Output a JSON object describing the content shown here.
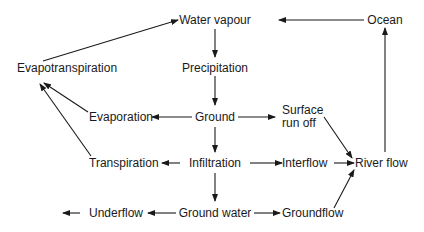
{
  "diagram": {
    "type": "flowchart",
    "title": "",
    "nodes": [
      {
        "id": "water_vapour",
        "label": "Water vapour"
      },
      {
        "id": "ocean",
        "label": "Ocean"
      },
      {
        "id": "evapotranspiration",
        "label": "Evapotranspiration"
      },
      {
        "id": "precipitation",
        "label": "Precipitation"
      },
      {
        "id": "evaporation",
        "label": "Evaporation"
      },
      {
        "id": "ground",
        "label": "Ground"
      },
      {
        "id": "surface_run_off",
        "label": "Surface run off",
        "lines": [
          "Surface",
          "run off"
        ]
      },
      {
        "id": "transpiration",
        "label": "Transpiration"
      },
      {
        "id": "infiltration",
        "label": "Infiltration"
      },
      {
        "id": "interflow",
        "label": "Interflow"
      },
      {
        "id": "river_flow",
        "label": "River flow"
      },
      {
        "id": "underflow",
        "label": "Underflow"
      },
      {
        "id": "ground_water",
        "label": "Ground water"
      },
      {
        "id": "groundflow",
        "label": "Groundflow"
      }
    ],
    "edges": [
      {
        "from": "ocean",
        "to": "water_vapour"
      },
      {
        "from": "evapotranspiration",
        "to": "water_vapour"
      },
      {
        "from": "water_vapour",
        "to": "precipitation"
      },
      {
        "from": "precipitation",
        "to": "ground"
      },
      {
        "from": "ground",
        "to": "evaporation"
      },
      {
        "from": "ground",
        "to": "surface_run_off"
      },
      {
        "from": "ground",
        "to": "infiltration"
      },
      {
        "from": "evaporation",
        "to": "evapotranspiration"
      },
      {
        "from": "transpiration",
        "to": "evapotranspiration"
      },
      {
        "from": "infiltration",
        "to": "transpiration"
      },
      {
        "from": "infiltration",
        "to": "interflow"
      },
      {
        "from": "infiltration",
        "to": "ground_water"
      },
      {
        "from": "surface_run_off",
        "to": "river_flow"
      },
      {
        "from": "interflow",
        "to": "river_flow"
      },
      {
        "from": "groundflow",
        "to": "river_flow"
      },
      {
        "from": "river_flow",
        "to": "ocean"
      },
      {
        "from": "ground_water",
        "to": "underflow"
      },
      {
        "from": "ground_water",
        "to": "groundflow"
      },
      {
        "from": "underflow",
        "to": "outflow"
      }
    ]
  }
}
